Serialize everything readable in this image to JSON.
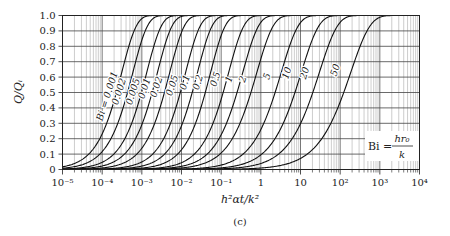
{
  "chart_data": {
    "type": "line",
    "title": "",
    "caption": "(c)",
    "xlabel": "h²αt/k²",
    "ylabel": "Q/Qᵢ",
    "xscale": "log",
    "xlim": [
      1e-05,
      10000.0
    ],
    "ylim": [
      0,
      1.0
    ],
    "grid": true,
    "x_tick_labels": [
      "10⁻⁵",
      "10⁻⁴",
      "10⁻³",
      "10⁻²",
      "10⁻¹",
      "1",
      "10",
      "10²",
      "10³",
      "10⁴"
    ],
    "x_tick_exponents": [
      -5,
      -4,
      -3,
      -2,
      -1,
      0,
      1,
      2,
      3,
      4
    ],
    "y_tick_labels": [
      "0",
      "0.1",
      "0.2",
      "0.3",
      "0.4",
      "0.5",
      "0.6",
      "0.7",
      "0.8",
      "0.9",
      "1.0"
    ],
    "y_ticks": [
      0,
      0.1,
      0.2,
      0.3,
      0.4,
      0.5,
      0.6,
      0.7,
      0.8,
      0.9,
      1.0
    ],
    "annotation": {
      "text": "Bi = hr₀/k",
      "lhs": "Bi =",
      "num": "hr₀",
      "den": "k"
    },
    "series_label_prefix": "Bi = ",
    "series": [
      {
        "name": "0.001",
        "log10x_at_half": -3.64,
        "width": 0.5,
        "label_pos": [
          -3.7,
          0.47
        ]
      },
      {
        "name": "0.002",
        "log10x_at_half": -3.36,
        "width": 0.5,
        "label_pos": [
          -3.4,
          0.5
        ]
      },
      {
        "name": "0.005",
        "log10x_at_half": -3.01,
        "width": 0.5,
        "label_pos": [
          -3.05,
          0.5
        ]
      },
      {
        "name": "0.01",
        "log10x_at_half": -2.74,
        "width": 0.5,
        "label_pos": [
          -2.76,
          0.52
        ]
      },
      {
        "name": "0.02",
        "log10x_at_half": -2.43,
        "width": 0.5,
        "label_pos": [
          -2.46,
          0.53
        ]
      },
      {
        "name": "0.05",
        "log10x_at_half": -2.03,
        "width": 0.5,
        "label_pos": [
          -2.06,
          0.54
        ]
      },
      {
        "name": "0.1",
        "log10x_at_half": -1.73,
        "width": 0.5,
        "label_pos": [
          -1.74,
          0.56
        ]
      },
      {
        "name": "0.2",
        "log10x_at_half": -1.4,
        "width": 0.5,
        "label_pos": [
          -1.41,
          0.56
        ]
      },
      {
        "name": "0.5",
        "log10x_at_half": -0.95,
        "width": 0.52,
        "label_pos": [
          -0.97,
          0.58
        ]
      },
      {
        "name": "1",
        "log10x_at_half": -0.6,
        "width": 0.54,
        "label_pos": [
          -0.63,
          0.58
        ]
      },
      {
        "name": "2",
        "log10x_at_half": -0.25,
        "width": 0.56,
        "label_pos": [
          -0.28,
          0.58
        ]
      },
      {
        "name": "5",
        "log10x_at_half": 0.36,
        "width": 0.58,
        "label_pos": [
          0.33,
          0.6
        ]
      },
      {
        "name": "10",
        "log10x_at_half": 0.86,
        "width": 0.6,
        "label_pos": [
          0.83,
          0.62
        ]
      },
      {
        "name": "20",
        "log10x_at_half": 1.31,
        "width": 0.62,
        "label_pos": [
          1.28,
          0.62
        ]
      },
      {
        "name": "50",
        "log10x_at_half": 2.09,
        "width": 0.66,
        "label_pos": [
          2.05,
          0.64
        ]
      }
    ]
  }
}
